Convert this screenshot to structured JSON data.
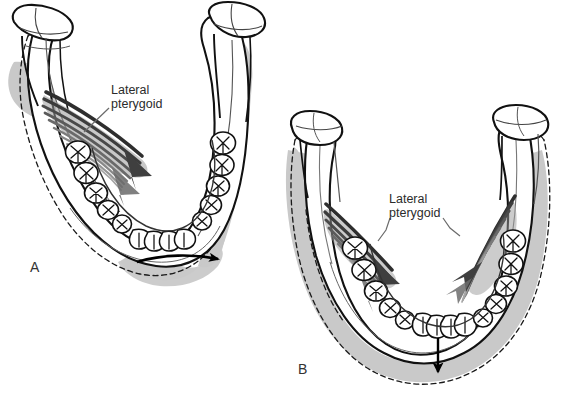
{
  "figure": {
    "background_color": "#ffffff",
    "width": 567,
    "height": 394
  },
  "colors": {
    "outline": "#111111",
    "bone_fill": "#ffffff",
    "shadow_gray": "#c9c9c9",
    "shadow_gray_dark": "#b4b4b4",
    "muscle_dark": "#3a3a3a",
    "muscle_mid": "#6e6e6e",
    "muscle_light": "#9a9a9a",
    "text": "#2b2b2b",
    "arrow": "#000000"
  },
  "panels": [
    {
      "id": "A",
      "letter": "A",
      "letter_x": 30,
      "letter_y": 268,
      "description": "Mandible viewed from above showing unilateral lateral pterygoid contraction producing lateral (mediotrusive) excursion",
      "annotation": {
        "name": "lateral-pterygoid",
        "line1": "Lateral",
        "line2": "pterygoid",
        "text_x": 111,
        "text_y1": 90,
        "text_y2": 104,
        "leader_from": [
          109,
          107
        ],
        "leader_to": [
          84,
          131
        ]
      },
      "movement": {
        "type": "curved",
        "label": "lateral excursion",
        "path": "M 137 262 C 163 254, 193 254, 221 259",
        "arrowhead_at": [
          224,
          260
        ]
      },
      "muscle": {
        "side": "left",
        "direction": "down-right",
        "fiber_count": 9
      }
    },
    {
      "id": "B",
      "letter": "B",
      "letter_x": 298,
      "letter_y": 370,
      "description": "Mandible viewed from above showing bilateral lateral pterygoid contraction producing protrusion / depression",
      "annotation": {
        "name": "lateral-pterygoid",
        "line1": "Lateral",
        "line2": "pterygoid",
        "text_x": 389,
        "text_y1": 199,
        "text_y2": 213,
        "leader_left_from": [
          388,
          218
        ],
        "leader_left_to": [
          383,
          238
        ],
        "leader_right_from": [
          443,
          218
        ],
        "leader_right_to": [
          454,
          233
        ]
      },
      "movement": {
        "type": "straight",
        "label": "depression",
        "from": [
          438,
          340
        ],
        "to": [
          438,
          378
        ]
      },
      "muscle": {
        "side": "bilateral",
        "direction": "converging-inferior-medial",
        "fiber_count": 9
      }
    }
  ],
  "anatomy_labels": {
    "condyle": "condyle",
    "coronoid_process": "coronoid process",
    "ramus": "ramus",
    "body": "body",
    "dental_arch": "dental arch",
    "molars": "molars",
    "premolars": "premolars",
    "incisors": "incisors",
    "dashed_outline": "original (rest) position outline"
  }
}
